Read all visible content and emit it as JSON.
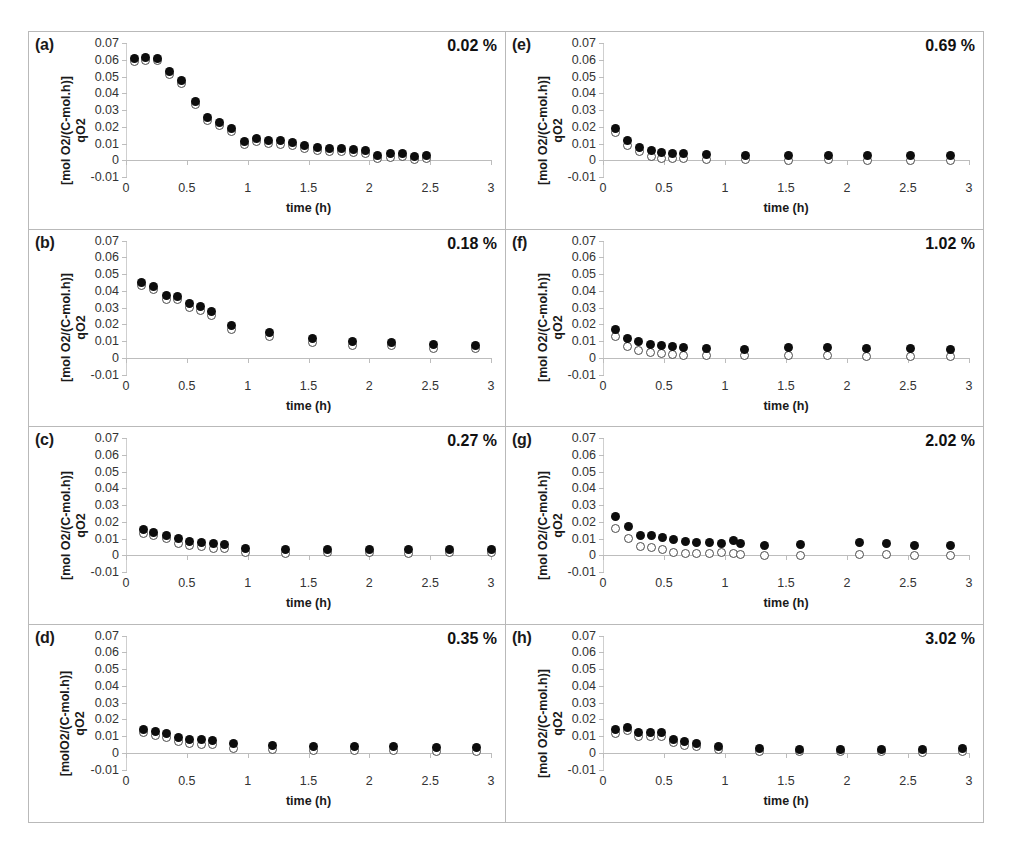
{
  "figure": {
    "panel_letters": [
      "(a)",
      "(b)",
      "(c)",
      "(d)",
      "(e)",
      "(f)",
      "(g)",
      "(h)"
    ],
    "y_title_line1": "qO2",
    "y_title_line2": "[mol O2/(C-mol.h)]",
    "y_title_line2_alt": "[molO2/(C-mol.h)]",
    "x_title": "time (h)",
    "y_tick_labels": [
      "0.07",
      "0.06",
      "0.05",
      "0.04",
      "0.03",
      "0.02",
      "0.01",
      "0",
      "-0.01"
    ],
    "x_tick_labels": [
      "0",
      "0.5",
      "1",
      "1.5",
      "2",
      "2.5",
      "3"
    ],
    "series_names": [
      "filled-circle-series",
      "open-circle-series"
    ],
    "colors": {
      "filled_marker": "#0d0d0d",
      "open_marker_edge": "#4a4a4a",
      "axis": "#bdbdbd",
      "panel_border": "#b9b9b9",
      "text": "#1a1a1a"
    }
  },
  "chart_data": [
    {
      "type": "scatter",
      "panel": "(a)",
      "title": "0.02 %",
      "xlabel": "time (h)",
      "ylabel": "qO2 [mol O2/(C-mol.h)]",
      "xlim": [
        0,
        3
      ],
      "ylim": [
        -0.01,
        0.07
      ],
      "grid": false,
      "x": [
        0.07,
        0.16,
        0.26,
        0.36,
        0.46,
        0.57,
        0.67,
        0.77,
        0.87,
        0.97,
        1.07,
        1.17,
        1.27,
        1.37,
        1.47,
        1.57,
        1.67,
        1.77,
        1.87,
        1.97,
        2.07,
        2.17,
        2.27,
        2.37,
        2.47
      ],
      "series": [
        {
          "name": "filled-circle-series",
          "marker": "filled",
          "values": [
            0.0605,
            0.0615,
            0.061,
            0.053,
            0.0478,
            0.0348,
            0.0258,
            0.0225,
            0.0192,
            0.0112,
            0.0128,
            0.0118,
            0.0115,
            0.0105,
            0.0088,
            0.0075,
            0.007,
            0.007,
            0.0065,
            0.0058,
            0.003,
            0.0038,
            0.0042,
            0.0022,
            0.003
          ]
        },
        {
          "name": "open-circle-series",
          "marker": "open",
          "values": [
            0.0588,
            0.0598,
            0.0595,
            0.0512,
            0.0458,
            0.033,
            0.024,
            0.0205,
            0.0172,
            0.0095,
            0.011,
            0.01,
            0.0096,
            0.0086,
            0.0068,
            0.0056,
            0.0052,
            0.0052,
            0.0046,
            0.0038,
            0.0012,
            0.0018,
            0.0022,
            0.0004,
            0.001
          ]
        }
      ]
    },
    {
      "type": "scatter",
      "panel": "(b)",
      "title": "0.18 %",
      "xlabel": "time (h)",
      "ylabel": "qO2 [mol O2/(C-mol.h)]",
      "xlim": [
        0,
        3
      ],
      "ylim": [
        -0.01,
        0.07
      ],
      "grid": false,
      "x": [
        0.13,
        0.23,
        0.33,
        0.42,
        0.52,
        0.61,
        0.7,
        0.87,
        1.18,
        1.53,
        1.86,
        2.18,
        2.53,
        2.87
      ],
      "series": [
        {
          "name": "filled-circle-series",
          "marker": "filled",
          "values": [
            0.045,
            0.0425,
            0.037,
            0.0368,
            0.0322,
            0.0305,
            0.0278,
            0.019,
            0.0148,
            0.0112,
            0.0098,
            0.0092,
            0.0078,
            0.0075
          ]
        },
        {
          "name": "open-circle-series",
          "marker": "open",
          "values": [
            0.043,
            0.0405,
            0.0348,
            0.0345,
            0.0298,
            0.0282,
            0.0252,
            0.0168,
            0.0126,
            0.009,
            0.0076,
            0.0072,
            0.0058,
            0.0054
          ]
        }
      ]
    },
    {
      "type": "scatter",
      "panel": "(c)",
      "title": "0.27 %",
      "xlabel": "time (h)",
      "ylabel": "qO2 [mol O2/(C-mol.h)]",
      "xlim": [
        0,
        3
      ],
      "ylim": [
        -0.01,
        0.07
      ],
      "grid": false,
      "x": [
        0.14,
        0.23,
        0.33,
        0.43,
        0.52,
        0.62,
        0.72,
        0.81,
        0.98,
        1.31,
        1.66,
        2.0,
        2.32,
        2.66,
        3.0
      ],
      "series": [
        {
          "name": "filled-circle-series",
          "marker": "filled",
          "values": [
            0.0152,
            0.0138,
            0.012,
            0.0098,
            0.0085,
            0.0078,
            0.007,
            0.0062,
            0.004,
            0.0035,
            0.0035,
            0.0036,
            0.0034,
            0.0035,
            0.0036
          ]
        },
        {
          "name": "open-circle-series",
          "marker": "open",
          "values": [
            0.013,
            0.0115,
            0.0098,
            0.0072,
            0.0058,
            0.0052,
            0.0042,
            0.0038,
            0.0016,
            0.0012,
            0.0014,
            0.0014,
            0.0012,
            0.0014,
            0.0014
          ]
        }
      ]
    },
    {
      "type": "scatter",
      "panel": "(d)",
      "title": "0.35 %",
      "xlabel": "time (h)",
      "ylabel": "qO2 [molO2/(C-mol.h)]",
      "xlim": [
        0,
        3
      ],
      "ylim": [
        -0.01,
        0.07
      ],
      "grid": false,
      "x": [
        0.14,
        0.24,
        0.33,
        0.43,
        0.52,
        0.62,
        0.71,
        0.88,
        1.2,
        1.54,
        1.88,
        2.2,
        2.55,
        2.88
      ],
      "series": [
        {
          "name": "filled-circle-series",
          "marker": "filled",
          "values": [
            0.014,
            0.0128,
            0.0112,
            0.0092,
            0.0082,
            0.0078,
            0.0072,
            0.0055,
            0.0042,
            0.004,
            0.0038,
            0.0036,
            0.003,
            0.0032
          ]
        },
        {
          "name": "open-circle-series",
          "marker": "open",
          "values": [
            0.0118,
            0.0105,
            0.0092,
            0.0068,
            0.0056,
            0.0052,
            0.0048,
            0.0026,
            0.0018,
            0.0016,
            0.0016,
            0.0014,
            0.0008,
            0.0008
          ]
        }
      ]
    },
    {
      "type": "scatter",
      "panel": "(e)",
      "title": "0.69 %",
      "xlabel": "time (h)",
      "ylabel": "qO2 [mol O2/(C-mol.h)]",
      "xlim": [
        0,
        3
      ],
      "ylim": [
        -0.01,
        0.07
      ],
      "grid": false,
      "x": [
        0.1,
        0.2,
        0.3,
        0.4,
        0.48,
        0.57,
        0.66,
        0.85,
        1.17,
        1.52,
        1.85,
        2.17,
        2.52,
        2.85
      ],
      "series": [
        {
          "name": "filled-circle-series",
          "marker": "filled",
          "values": [
            0.0192,
            0.0116,
            0.0078,
            0.0058,
            0.0045,
            0.0042,
            0.0042,
            0.0032,
            0.003,
            0.0028,
            0.0027,
            0.0027,
            0.0028,
            0.0028
          ]
        },
        {
          "name": "open-circle-series",
          "marker": "open",
          "values": [
            0.0165,
            0.0088,
            0.0055,
            0.002,
            0.0012,
            0.0012,
            0.0013,
            0.0002,
            0.0002,
            0.0001,
            0.0002,
            0.0001,
            0.0001,
            0.0001
          ]
        }
      ]
    },
    {
      "type": "scatter",
      "panel": "(f)",
      "title": "1.02 %",
      "xlabel": "time (h)",
      "ylabel": "qO2 [mol O2/(C-mol.h)]",
      "xlim": [
        0,
        3
      ],
      "ylim": [
        -0.01,
        0.07
      ],
      "grid": false,
      "x": [
        0.1,
        0.2,
        0.29,
        0.39,
        0.48,
        0.57,
        0.66,
        0.85,
        1.16,
        1.52,
        1.84,
        2.16,
        2.52,
        2.85
      ],
      "series": [
        {
          "name": "filled-circle-series",
          "marker": "filled",
          "values": [
            0.0168,
            0.0112,
            0.0095,
            0.0078,
            0.0072,
            0.0065,
            0.0062,
            0.0058,
            0.0052,
            0.006,
            0.006,
            0.0054,
            0.0054,
            0.0052
          ]
        },
        {
          "name": "open-circle-series",
          "marker": "open",
          "values": [
            0.0128,
            0.0068,
            0.0046,
            0.003,
            0.0026,
            0.0018,
            0.0012,
            0.0014,
            0.0012,
            0.0016,
            0.0014,
            0.0008,
            0.0008,
            0.0008
          ]
        }
      ]
    },
    {
      "type": "scatter",
      "panel": "(g)",
      "title": "2.02 %",
      "xlabel": "time (h)",
      "ylabel": "qO2 [mol O2/(C-mol.h)]",
      "xlim": [
        0,
        3
      ],
      "ylim": [
        -0.01,
        0.07
      ],
      "grid": false,
      "x": [
        0.1,
        0.21,
        0.31,
        0.4,
        0.49,
        0.58,
        0.68,
        0.77,
        0.87,
        0.97,
        1.07,
        1.13,
        1.32,
        1.62,
        2.1,
        2.32,
        2.55,
        2.85
      ],
      "series": [
        {
          "name": "filled-circle-series",
          "marker": "filled",
          "values": [
            0.0232,
            0.017,
            0.0118,
            0.0115,
            0.0105,
            0.0092,
            0.008,
            0.0078,
            0.0078,
            0.0068,
            0.0088,
            0.007,
            0.0058,
            0.0064,
            0.0075,
            0.007,
            0.006,
            0.006
          ]
        },
        {
          "name": "open-circle-series",
          "marker": "open",
          "values": [
            0.0162,
            0.0098,
            0.0052,
            0.0048,
            0.0035,
            0.0018,
            0.0012,
            0.0012,
            0.001,
            0.0018,
            0.0012,
            0.0002,
            0.0,
            0.0,
            0.0006,
            0.0002,
            0.0,
            0.0
          ]
        }
      ]
    },
    {
      "type": "scatter",
      "panel": "(h)",
      "title": "3.02 %",
      "xlabel": "time (h)",
      "ylabel": "qO2 [mol O2/(C-mol.h)]",
      "xlim": [
        0,
        3
      ],
      "ylim": [
        -0.01,
        0.07
      ],
      "grid": false,
      "x": [
        0.1,
        0.2,
        0.29,
        0.39,
        0.48,
        0.58,
        0.67,
        0.77,
        0.95,
        1.28,
        1.61,
        1.95,
        2.28,
        2.62,
        2.95
      ],
      "series": [
        {
          "name": "filled-circle-series",
          "marker": "filled",
          "values": [
            0.0138,
            0.0152,
            0.0118,
            0.0122,
            0.0118,
            0.0082,
            0.0068,
            0.0058,
            0.004,
            0.0025,
            0.0022,
            0.0022,
            0.0022,
            0.002,
            0.0024
          ]
        },
        {
          "name": "open-circle-series",
          "marker": "open",
          "values": [
            0.0115,
            0.013,
            0.0098,
            0.01,
            0.0095,
            0.006,
            0.0046,
            0.0036,
            0.0018,
            0.0006,
            0.0006,
            0.0006,
            0.0006,
            0.0004,
            0.0006
          ]
        }
      ]
    }
  ]
}
